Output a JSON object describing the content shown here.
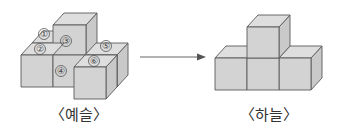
{
  "figure_left": {
    "caption": "〈예슬〉",
    "labels": [
      "①",
      "②",
      "③",
      "④",
      "⑤",
      "⑥"
    ]
  },
  "figure_right": {
    "caption": "〈하늘〉"
  },
  "arrow": {
    "direction": "right"
  },
  "colors": {
    "cube_front": "#d3d3d3",
    "cube_top": "#dedede",
    "cube_side": "#c9c9c9",
    "edge": "#5a5a5a"
  }
}
